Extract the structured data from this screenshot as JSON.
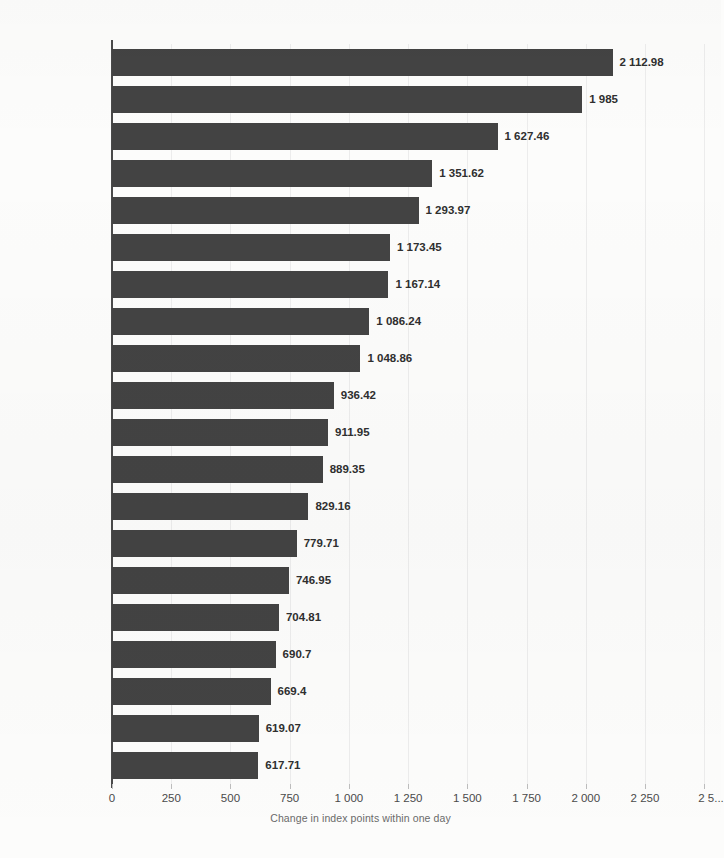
{
  "chart_data": {
    "type": "bar",
    "orientation": "horizontal",
    "title": "",
    "subtitle": "",
    "xlabel": "Change in index points within one day",
    "ylabel": "",
    "xlim": [
      0,
      2250
    ],
    "grid": true,
    "legend": null,
    "categories": [
      "03.24.2020",
      "03.13.2020",
      "04.06.2020",
      "03.26.2020",
      "03.02.2020",
      "03.04.2020",
      "03.10.2020",
      "12.26.2018",
      "03.17.2020",
      "10.13.2008",
      "05.18.2020",
      "10.28.2008",
      "06.05.2020",
      "04.08.2020",
      "01.04.2019",
      "04.17.2020",
      "03.30.2020",
      "03.26.2018",
      "08.26.2015",
      "11.28.2018"
    ],
    "values": [
      2112.98,
      1985,
      1627.46,
      1351.62,
      1293.97,
      1173.45,
      1167.14,
      1086.24,
      1048.86,
      936.42,
      911.95,
      889.35,
      829.16,
      779.71,
      746.95,
      704.81,
      690.7,
      669.4,
      619.07,
      617.71
    ],
    "value_labels": [
      "2 112.98",
      "1 985",
      "1 627.46",
      "1 351.62",
      "1 293.97",
      "1 173.45",
      "1 167.14",
      "1 086.24",
      "1 048.86",
      "936.42",
      "911.95",
      "889.35",
      "829.16",
      "779.71",
      "746.95",
      "704.81",
      "690.7",
      "669.4",
      "619.07",
      "617.71"
    ],
    "xticks": [
      0,
      250,
      500,
      750,
      1000,
      1250,
      1500,
      1750,
      2000,
      2250,
      2500
    ],
    "xtick_labels": [
      "0",
      "250",
      "500",
      "750",
      "1 000",
      "1 250",
      "1 500",
      "1 750",
      "2 000",
      "2 250",
      "2 5..."
    ],
    "bar_color": "#434343",
    "label_color": "#4a4a4a",
    "background_color": "#fcfcfb"
  }
}
